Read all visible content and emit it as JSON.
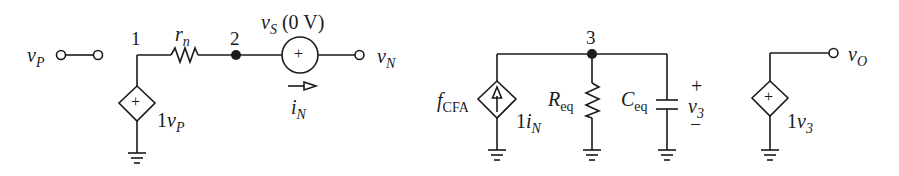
{
  "figure": {
    "type": "circuit-schematic",
    "colors": {
      "wire": "#1a1a1a",
      "background": "#ffffff"
    }
  },
  "left_circuit": {
    "input_terminal": {
      "var": "v",
      "sub": "P"
    },
    "node1": "1",
    "node2": "2",
    "resistor": {
      "var": "r",
      "sub": "n"
    },
    "voltage_source": {
      "var": "v",
      "sub": "S",
      "value": "(0 V)",
      "polarity": "+"
    },
    "output_terminal": {
      "var": "v",
      "sub": "N"
    },
    "current": {
      "var": "i",
      "sub": "N"
    },
    "dependent_source": {
      "gain": "1",
      "var": "v",
      "sub": "P",
      "polarity": "+"
    }
  },
  "middle_circuit": {
    "node3": "3",
    "dependent_current_source": {
      "func": "f",
      "func_sub": "CFA",
      "gain": "1",
      "var": "i",
      "sub": "N"
    },
    "resistor": {
      "var": "R",
      "sub": "eq"
    },
    "capacitor": {
      "var": "C",
      "sub": "eq"
    },
    "voltage": {
      "var": "v",
      "sub": "3",
      "plus": "+",
      "minus": "−"
    }
  },
  "right_circuit": {
    "dependent_source": {
      "gain": "1",
      "var": "v",
      "sub": "3",
      "polarity": "+"
    },
    "output_terminal": {
      "var": "v",
      "sub": "O"
    }
  }
}
